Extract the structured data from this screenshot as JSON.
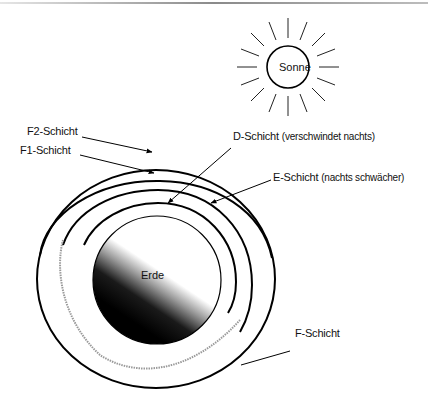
{
  "diagram": {
    "sun": {
      "label": "Sonne"
    },
    "earth": {
      "label": "Erde"
    },
    "layers": [
      {
        "id": "f2",
        "label": "F2-Schicht",
        "note": ""
      },
      {
        "id": "f1",
        "label": "F1-Schicht",
        "note": ""
      },
      {
        "id": "d",
        "label": "D-Schicht",
        "note": "(verschwindet nachts)"
      },
      {
        "id": "e",
        "label": "E-Schicht",
        "note": "(nachts schwächer)"
      },
      {
        "id": "f",
        "label": "F-Schicht",
        "note": ""
      }
    ],
    "colors": {
      "line": "#000000",
      "dotted_layer": "#9a9a9a",
      "background": "#ffffff"
    }
  }
}
